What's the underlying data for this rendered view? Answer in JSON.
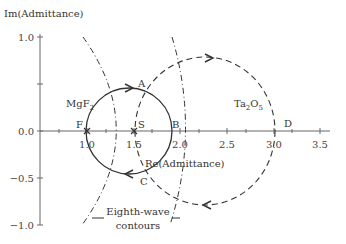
{
  "axes": {
    "y_label": "Im(Admittance)",
    "x_label": "Re(Admittance)",
    "x_ticks": [
      "1.0",
      "1.5",
      "2.0",
      "2.5",
      "3.0",
      "3.5"
    ],
    "y_ticks": [
      "1.0",
      "0.5",
      "0.0",
      "−0.5",
      "−1.0"
    ]
  },
  "points": {
    "F": "F",
    "S": "S",
    "B": "B",
    "D": "D",
    "A": "A",
    "C": "C"
  },
  "materials": {
    "mgf2": "MgF",
    "mgf2_sub": "2",
    "ta2o5_a": "Ta",
    "ta2o5_sub1": "2",
    "ta2o5_b": "O",
    "ta2o5_sub2": "5"
  },
  "annotation": {
    "line1": "Eighth-wave",
    "line2": "contours"
  },
  "colors": {
    "line": "#333333",
    "axis": "#666666"
  }
}
